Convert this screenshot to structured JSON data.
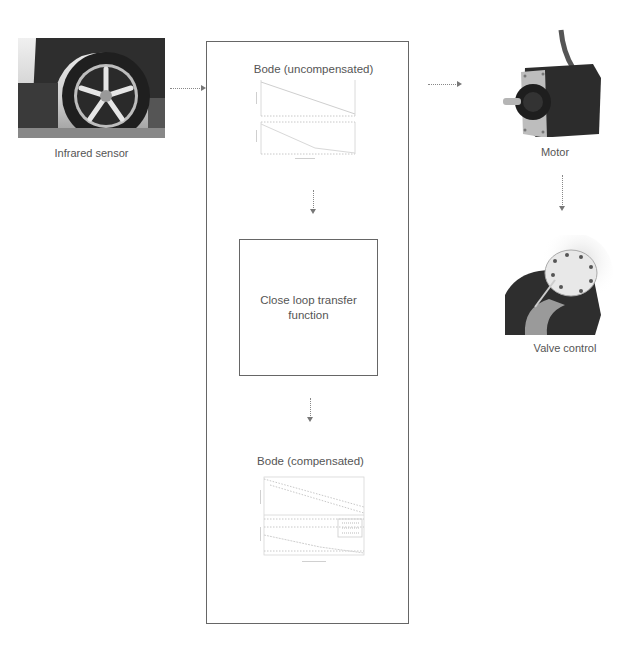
{
  "diagram": {
    "nodes": {
      "sensor": {
        "label": "Infrared sensor",
        "icon": "car-wheel-photo"
      },
      "bode_uncompensated": {
        "title": "Bode (uncompensated)",
        "xlabel": "Frequency (rad/s)"
      },
      "closed_loop": {
        "label": "Close loop transfer function"
      },
      "bode_compensated": {
        "title": "Bode (compensated)",
        "xlabel": "Frequency (rad/s)"
      },
      "motor": {
        "label": "Motor",
        "icon": "stepper-motor-photo"
      },
      "valve": {
        "label": "Valve control",
        "icon": "valve-photo"
      }
    },
    "edges": [
      {
        "from": "sensor",
        "to": "controller-box",
        "style": "dotted-arrow"
      },
      {
        "from": "bode_uncompensated",
        "to": "closed_loop",
        "style": "dotted-arrow"
      },
      {
        "from": "closed_loop",
        "to": "bode_compensated",
        "style": "dotted-arrow"
      },
      {
        "from": "controller-box",
        "to": "motor",
        "style": "dotted-arrow"
      },
      {
        "from": "motor",
        "to": "valve",
        "style": "dotted-arrow"
      }
    ],
    "colors": {
      "line": "#666666",
      "arrow": "#777777",
      "text": "#555555"
    }
  }
}
